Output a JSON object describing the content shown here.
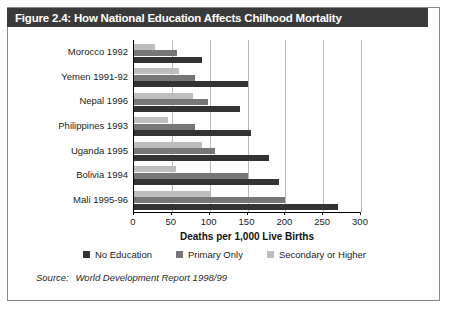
{
  "figure": {
    "title": "Figure 2.4: How National Education Affects Chilhood Mortality",
    "source_prefix": "Source:",
    "source_text": "World Development Report 1998/99"
  },
  "colors": {
    "title_bar": "#3a3a3a",
    "no_education": "#333333",
    "primary_only": "#777777",
    "secondary_higher": "#bdbdbd",
    "gridline": "#b9b9b9",
    "axis": "#000000"
  },
  "chart_data": {
    "type": "bar",
    "orientation": "horizontal",
    "title": "Figure 2.4: How National Education Affects Chilhood Mortality",
    "xlabel": "Deaths per 1,000 Live Births",
    "ylabel": "",
    "xlim": [
      0,
      300
    ],
    "xticks": [
      0,
      50,
      100,
      150,
      200,
      250,
      300
    ],
    "xtick_labels": [
      "0",
      "50",
      "100",
      "150",
      "200",
      "250",
      "300"
    ],
    "grid": true,
    "grid_axis": "x",
    "legend_position": "bottom",
    "categories": [
      "Morocco 1992",
      "Yemen 1991-92",
      "Nepal 1996",
      "Philippines 1993",
      "Uganda 1995",
      "Bolivia 1994",
      "Mali 1995-96"
    ],
    "series": [
      {
        "name": "No Education",
        "color": "#333333",
        "values": [
          90,
          150,
          140,
          155,
          178,
          192,
          270
        ]
      },
      {
        "name": "Primary Only",
        "color": "#777777",
        "values": [
          57,
          80,
          98,
          80,
          107,
          150,
          200
        ]
      },
      {
        "name": "Secondary or Higher",
        "color": "#bdbdbd",
        "values": [
          28,
          60,
          78,
          45,
          90,
          55,
          100
        ]
      }
    ]
  }
}
